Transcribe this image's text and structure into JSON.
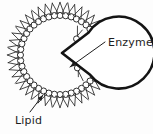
{
  "figure": {
    "title": "Lipid micelle with enzyme cleft",
    "background_color": "#fdfdfd",
    "ink_color": "#1d1d1d",
    "labels": [
      {
        "id": "enzyme",
        "text": "Enzyme",
        "x": 108,
        "y": 46,
        "leader_from": [
          105,
          42
        ],
        "leader_to": [
          70,
          67
        ],
        "arrow_direction": "down-left"
      },
      {
        "id": "lipid",
        "text": "Lipid",
        "x": 15,
        "y": 124,
        "leader_from": [
          30,
          112
        ],
        "leader_to": [
          43,
          95
        ],
        "arrow_direction": "up-right"
      }
    ],
    "micelle": {
      "center_x": 60,
      "center_y": 55,
      "core_radius": 36,
      "notch_opens_toward": "right",
      "notch_vertex": [
        62,
        53
      ],
      "notch_upper_edge": [
        92,
        30
      ],
      "notch_lower_edge": [
        92,
        76
      ],
      "lipid_count": 44,
      "head_radius": 3.1,
      "tail_length": 11,
      "tail_count_per_lipid": 2
    }
  }
}
